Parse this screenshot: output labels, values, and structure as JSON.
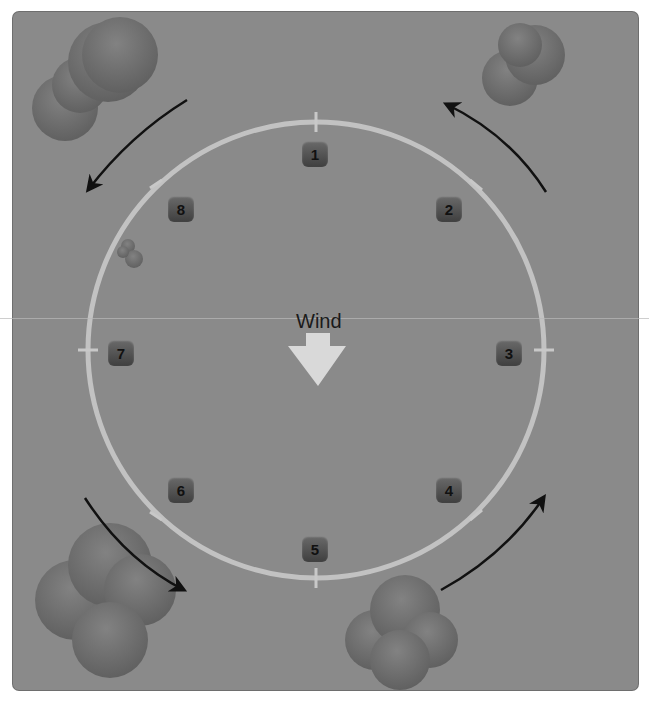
{
  "diagram": {
    "wind_label": "Wind",
    "markers": [
      {
        "label": "1",
        "x": 302,
        "y": 141
      },
      {
        "label": "2",
        "x": 436,
        "y": 196
      },
      {
        "label": "3",
        "x": 496,
        "y": 340
      },
      {
        "label": "4",
        "x": 436,
        "y": 477
      },
      {
        "label": "5",
        "x": 302,
        "y": 536
      },
      {
        "label": "6",
        "x": 168,
        "y": 477
      },
      {
        "label": "7",
        "x": 108,
        "y": 340
      },
      {
        "label": "8",
        "x": 168,
        "y": 196
      }
    ],
    "circle": {
      "cx": 316,
      "cy": 350,
      "r": 228,
      "color": "#c2c2c2"
    },
    "colors": {
      "background": "#8a8a8a",
      "cloud": "#6f6f6f",
      "arrow": "#111111",
      "wind_arrow": "#d9d9d9"
    }
  }
}
